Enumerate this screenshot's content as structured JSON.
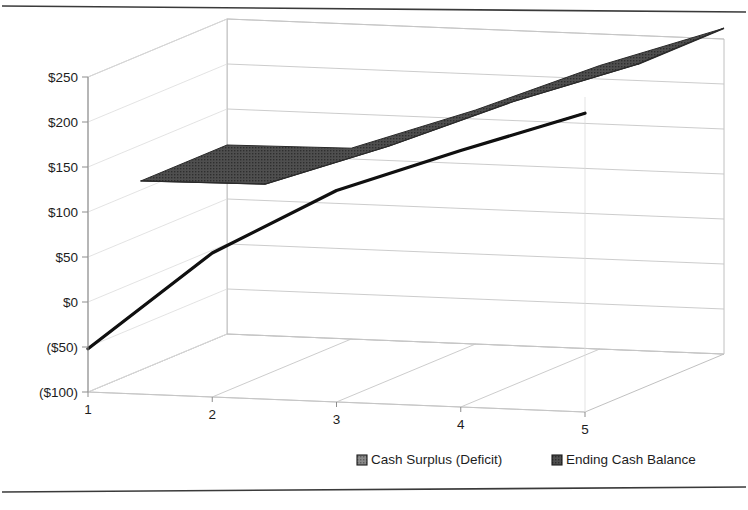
{
  "chart_data": {
    "type": "area",
    "title": "",
    "subtitle": "",
    "xlabel": "",
    "ylabel": "",
    "categories": [
      "1",
      "2",
      "3",
      "4",
      "5"
    ],
    "x": [
      1,
      2,
      3,
      4,
      5
    ],
    "ylim": [
      -100,
      250
    ],
    "ytick_values": [
      250,
      200,
      150,
      100,
      50,
      0,
      -50,
      -100
    ],
    "ytick_labels": [
      "$250",
      "$200",
      "$150",
      "$100",
      "$50",
      "$0",
      "($50)",
      "($100)"
    ],
    "xtick_labels": [
      "1",
      "2",
      "3",
      "4",
      "5"
    ],
    "grid": true,
    "legend_position": "bottom",
    "projection": "3d-ribbon",
    "series": [
      {
        "name": "Cash Surplus (Deficit)",
        "values": [
          -52,
          60,
          135,
          185,
          232
        ],
        "color": "#6e6e6e",
        "stroke": "#101010",
        "depth_index": 0
      },
      {
        "name": "Ending Cash Balance",
        "values": [
          110,
          112,
          160,
          215,
          262
        ],
        "color": "#4a4a4a",
        "stroke": "#2a2a2a",
        "depth_index": 1
      }
    ]
  },
  "legend": {
    "items": [
      {
        "label": "Cash Surplus (Deficit)",
        "swatch": "#6e6e6e"
      },
      {
        "label": "Ending Cash Balance",
        "swatch": "#4a4a4a"
      }
    ]
  },
  "axes": {
    "y_labels": [
      "$250",
      "$200",
      "$150",
      "$100",
      "$50",
      "$0",
      "($50)",
      "($100)"
    ],
    "x_labels": [
      "1",
      "2",
      "3",
      "4",
      "5"
    ]
  },
  "colors": {
    "background": "#ffffff",
    "frame": "#3a3a3a",
    "grid": "#c6c6c6",
    "text": "#1d1d1d",
    "series_front": "#6e6e6e",
    "series_back": "#4a4a4a"
  }
}
